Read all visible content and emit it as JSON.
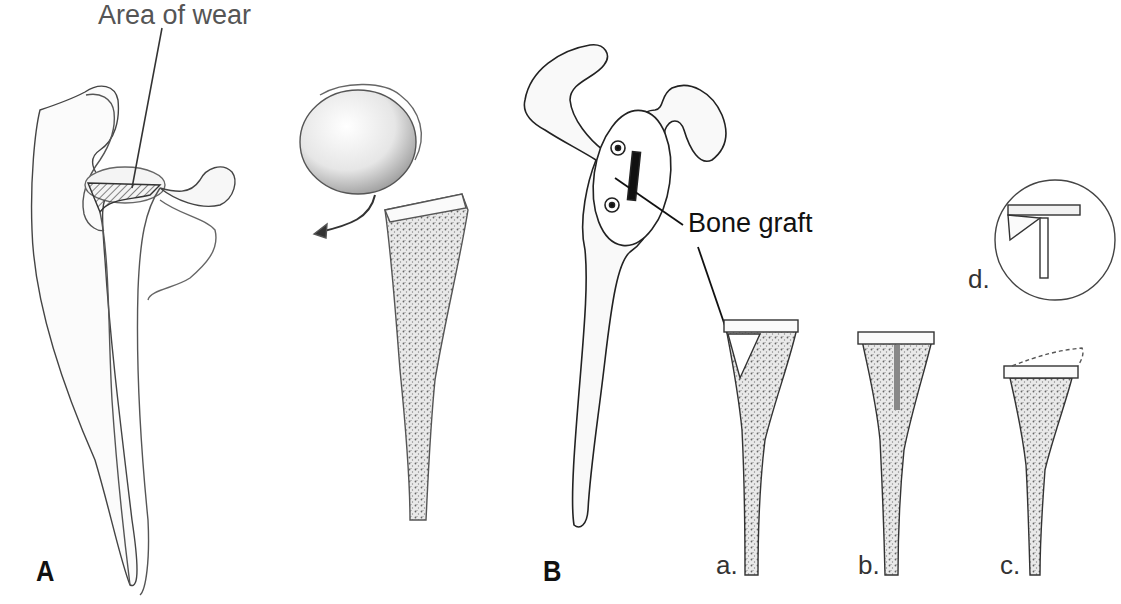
{
  "figure": {
    "panels": [
      {
        "id": "A",
        "label": "A",
        "callout": "Area of wear",
        "items": [
          "glenoid-wear-view",
          "humeral-head-prosthesis-subluxation"
        ]
      },
      {
        "id": "B",
        "label": "B",
        "callout": "Bone graft",
        "subfigures": [
          {
            "label": "a."
          },
          {
            "label": "b."
          },
          {
            "label": "c."
          },
          {
            "label": "d."
          }
        ]
      }
    ],
    "colors": {
      "ink": "#222222",
      "shade": "#8a8a8a",
      "background": "#ffffff"
    }
  }
}
